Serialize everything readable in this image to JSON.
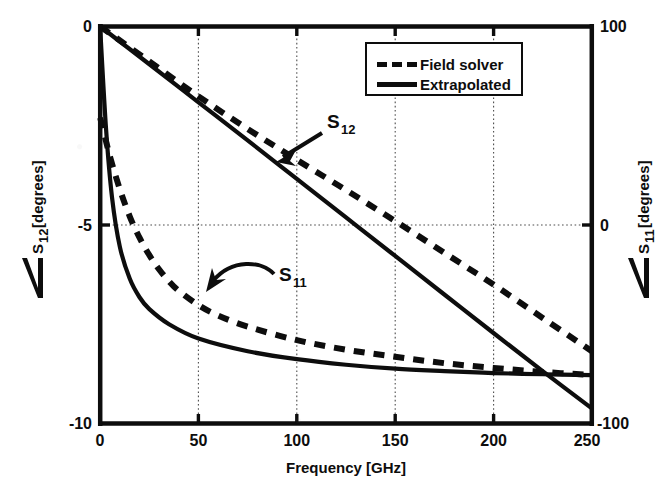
{
  "chart_data": {
    "type": "line",
    "title": "",
    "xlabel": "Frequency [GHz]",
    "ylabel": "∠S_12 [degrees]",
    "ylabel_left_symbol": "S",
    "ylabel_left_sub": "12",
    "ylabel_left_unit": "[degrees]",
    "ylabel_right_symbol": "S",
    "ylabel_right_sub": "11",
    "ylabel_right_unit": "[degrees]",
    "ylabel2": "∠S_11 [degrees]",
    "xlim": [
      0,
      250
    ],
    "ylim_left": [
      -10,
      0
    ],
    "ylim_right": [
      -100,
      100
    ],
    "xticks": [
      0,
      50,
      100,
      150,
      200,
      250
    ],
    "xticklabels": [
      "0",
      "50",
      "100",
      "150",
      "200",
      "250"
    ],
    "yticks_left": [
      0,
      -5,
      -10
    ],
    "yticklabels_left": [
      "0",
      "-5",
      "-10"
    ],
    "yticks_right": [
      100,
      0,
      -100
    ],
    "yticklabels_right": [
      "100",
      "0",
      "-100"
    ],
    "grid": true,
    "grid_style": "dotted",
    "legend_position": "top-right-inside",
    "legend": [
      {
        "label": "Field solver",
        "style": "dashed"
      },
      {
        "label": "Extrapolated",
        "style": "solid"
      }
    ],
    "annotations": [
      {
        "text": "S",
        "sub": "12",
        "x": 88,
        "y": -2.0
      },
      {
        "text": "S",
        "sub": "11",
        "x": 83,
        "y": -6.0
      }
    ],
    "series": [
      {
        "name": "S12 Extrapolated",
        "axis": "left",
        "style": "solid",
        "x": [
          0,
          25,
          50,
          75,
          100,
          125,
          150,
          175,
          200,
          225,
          250
        ],
        "values": [
          0.0,
          -0.95,
          -1.91,
          -2.87,
          -3.84,
          -4.81,
          -5.78,
          -6.75,
          -7.72,
          -8.68,
          -9.62
        ]
      },
      {
        "name": "S12 Field solver",
        "axis": "left",
        "style": "dashed",
        "x": [
          0,
          25,
          50,
          75,
          100,
          125,
          150,
          175,
          200,
          225,
          250
        ],
        "values": [
          0.0,
          -0.88,
          -1.76,
          -2.58,
          -3.36,
          -4.12,
          -4.9,
          -5.7,
          -6.5,
          -7.34,
          -8.18
        ]
      },
      {
        "name": "S11 Extrapolated",
        "axis": "left",
        "style": "solid",
        "x": [
          0,
          3,
          6,
          10,
          15,
          20,
          25,
          35,
          50,
          75,
          100,
          125,
          150,
          175,
          200,
          225,
          250
        ],
        "values": [
          -0.05,
          -2.6,
          -4.3,
          -5.55,
          -6.35,
          -6.82,
          -7.12,
          -7.5,
          -7.86,
          -8.18,
          -8.38,
          -8.52,
          -8.62,
          -8.68,
          -8.73,
          -8.76,
          -8.78
        ]
      },
      {
        "name": "S11 Field solver",
        "axis": "left",
        "style": "dashed",
        "x": [
          0,
          5,
          10,
          15,
          20,
          25,
          30,
          35,
          40,
          50,
          60,
          75,
          100,
          125,
          150,
          175,
          200,
          225,
          250
        ],
        "values": [
          -2.3,
          -3.28,
          -4.1,
          -4.78,
          -5.32,
          -5.76,
          -6.12,
          -6.42,
          -6.66,
          -7.02,
          -7.28,
          -7.56,
          -7.9,
          -8.14,
          -8.32,
          -8.48,
          -8.6,
          -8.7,
          -8.78
        ]
      }
    ]
  },
  "colors": {
    "ink": "#0d0d0d",
    "background": "#ffffff",
    "grid": "#4d4d4d"
  }
}
